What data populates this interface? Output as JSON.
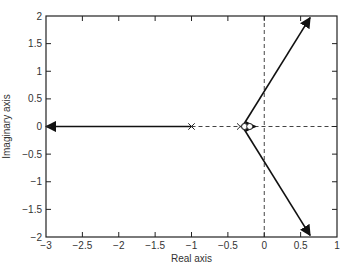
{
  "chart_data": {
    "type": "line",
    "title": "",
    "xlabel": "Real axis",
    "ylabel": "Imaginary axis",
    "xlim": [
      -3,
      1
    ],
    "ylim": [
      -2,
      2
    ],
    "grid": false,
    "xticks": [
      -3,
      -2.5,
      -2,
      -1.5,
      -1,
      -0.5,
      0,
      0.5,
      1
    ],
    "xtick_labels": [
      "−3",
      "−2.5",
      "−2",
      "−1.5",
      "−1",
      "−0.5",
      "0",
      "0.5",
      "1"
    ],
    "yticks": [
      2,
      1.5,
      1,
      0.5,
      0,
      -0.5,
      -1,
      -1.5,
      -2
    ],
    "ytick_labels": [
      "2",
      "1.5",
      "1",
      "0.5",
      "0",
      "−0.5",
      "−1",
      "−1.5",
      "−2"
    ],
    "poles": [
      {
        "re": -1.0,
        "im": 0
      },
      {
        "re": -0.33,
        "im": 0
      }
    ],
    "zeros": [
      {
        "re": -0.27,
        "im": 0
      },
      {
        "re": -0.2,
        "im": 0
      }
    ],
    "series": [
      {
        "name": "real-axis-branch-left",
        "style": "solid",
        "arrow": "end",
        "points": [
          [
            -1.0,
            0
          ],
          [
            -3.0,
            0
          ]
        ]
      },
      {
        "name": "real-axis-branch-right",
        "style": "solid",
        "arrow": "end",
        "points": [
          [
            -0.27,
            0
          ],
          [
            -0.12,
            0
          ]
        ]
      },
      {
        "name": "upper-branch",
        "style": "solid",
        "arrow": "end",
        "points": [
          [
            -0.3,
            0
          ],
          [
            0.63,
            1.97
          ]
        ]
      },
      {
        "name": "lower-branch",
        "style": "solid",
        "arrow": "end",
        "points": [
          [
            -0.3,
            0
          ],
          [
            0.63,
            -1.97
          ]
        ]
      }
    ],
    "reference_lines": [
      {
        "name": "real-axis-dashed",
        "style": "dashed",
        "points": [
          [
            -1.0,
            0
          ],
          [
            1.0,
            0
          ]
        ]
      },
      {
        "name": "imaginary-axis-dashed",
        "style": "dashed",
        "points": [
          [
            0,
            -2
          ],
          [
            0,
            2
          ]
        ]
      }
    ]
  }
}
